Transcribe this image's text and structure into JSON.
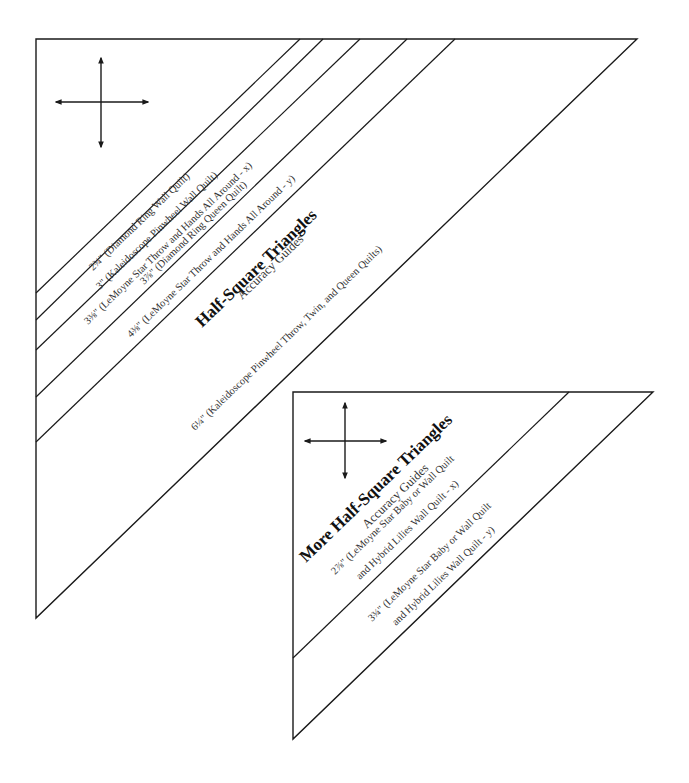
{
  "template_1": {
    "title": "Half-Square Triangles",
    "subtitle": "Accuracy Guides",
    "guides": [
      {
        "size": "2¾\"",
        "label": "2¾\" (Diamond Ring Wall Quilt)"
      },
      {
        "size": "3\"",
        "label": "3\" (Kaleidoscope Pinwheel Wall Quilt)"
      },
      {
        "size": "3⅜\"",
        "label": "3⅜\" (LeMoyne Star Throw and Hands All Around - x)"
      },
      {
        "size": "3⅞\"",
        "label": "3⅞\" (Diamond Ring Queen Quilt)"
      },
      {
        "size": "4⅜\"",
        "label": "4⅜\" (LeMoyne Star Throw and Hands All Around - y)"
      },
      {
        "size": "6¼\"",
        "label": "6¼\" (Kaleidoscope Pinwheel Throw, Twin, and Queen Quilts)"
      }
    ],
    "grain_icon": "four-way-arrow-icon"
  },
  "template_2": {
    "title": "More Half-Square Triangles",
    "subtitle": "Accuracy Guides",
    "guides": [
      {
        "size": "2⅞\"",
        "line1": "2⅞\" (LeMoyne Star Baby or Wall Quilt",
        "line2": "and Hybrid Lilies Wall Quilt - x)"
      },
      {
        "size": "3¾\"",
        "line1": "3¾\" (LeMoyne Star Baby or Wall Quilt",
        "line2": "and Hybrid Lilies Wall Quilt - y)"
      }
    ],
    "grain_icon": "four-way-arrow-icon"
  },
  "colors": {
    "line": "#1a1a1a",
    "text": "#333333",
    "background": "#ffffff"
  }
}
